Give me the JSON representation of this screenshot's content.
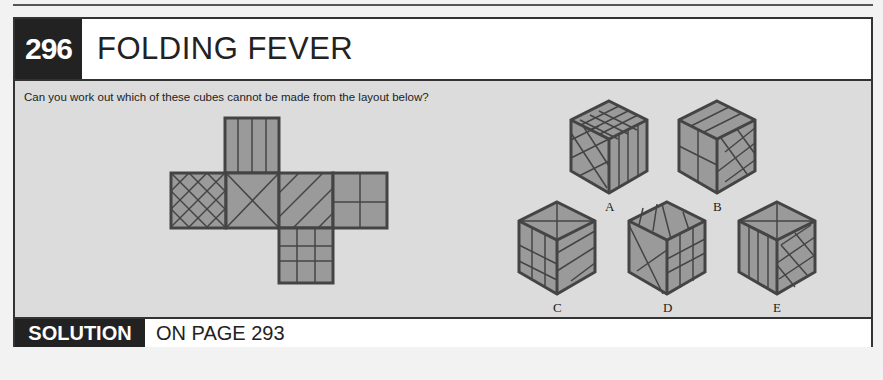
{
  "header": {
    "puzzle_number": "296",
    "title": "FOLDING FEVER"
  },
  "body": {
    "question": "Can you work out which of these cubes cannot be made from the layout below?"
  },
  "net": {
    "faces": [
      {
        "position": "top",
        "pattern": "vertical-stripes"
      },
      {
        "position": "left",
        "pattern": "cross-hatch"
      },
      {
        "position": "center-left",
        "pattern": "diagonal-x"
      },
      {
        "position": "center-right",
        "pattern": "diagonal-stripes"
      },
      {
        "position": "right",
        "pattern": "quarters"
      },
      {
        "position": "bottom",
        "pattern": "grid-3x3"
      }
    ]
  },
  "options": [
    {
      "label": "A"
    },
    {
      "label": "B"
    },
    {
      "label": "C"
    },
    {
      "label": "D"
    },
    {
      "label": "E"
    }
  ],
  "footer": {
    "solution_label": "SOLUTION",
    "solution_text": "ON PAGE 293"
  },
  "colors": {
    "dark": "#222222",
    "face_fill": "#9a9a9a",
    "panel_bg": "#dcdcdc",
    "line": "#444444"
  }
}
